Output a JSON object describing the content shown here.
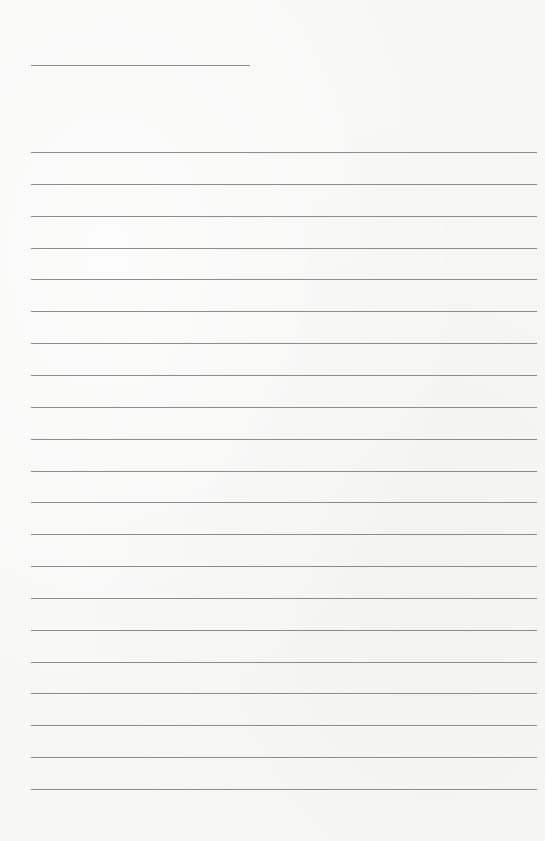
{
  "page": {
    "type": "lined-paper",
    "background_color": "#f7f7f6",
    "line_color": "#8c8c8c",
    "title_line": {
      "x": 31,
      "y": 65,
      "width": 219,
      "text": ""
    },
    "rules": {
      "count": 21,
      "x": 31,
      "first_y": 152,
      "spacing": 31.85,
      "width": 506,
      "lines": [
        "",
        "",
        "",
        "",
        "",
        "",
        "",
        "",
        "",
        "",
        "",
        "",
        "",
        "",
        "",
        "",
        "",
        "",
        "",
        "",
        ""
      ]
    }
  }
}
